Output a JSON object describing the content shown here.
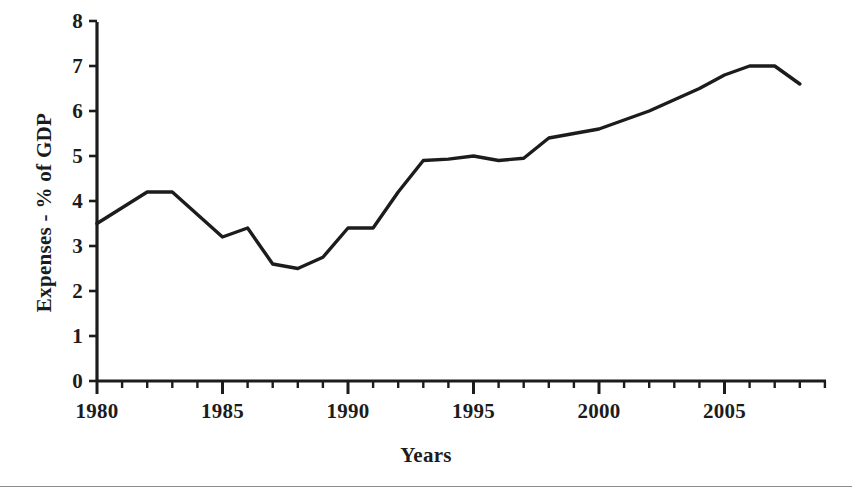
{
  "figure": {
    "background_color": "#ffffff",
    "ink_color": "#1c1c1c",
    "bottom_rule_color": "#8d8d8d"
  },
  "axes": {
    "y_title": "Expenses - % of GDP",
    "x_title": "Years",
    "y_tick_labels": [
      "0",
      "1",
      "2",
      "3",
      "4",
      "5",
      "6",
      "7",
      "8"
    ],
    "x_tick_labels": [
      "1980",
      "1985",
      "1990",
      "1995",
      "2000",
      "2005"
    ]
  },
  "chart_data": {
    "type": "line",
    "title": "",
    "subtitle": "",
    "xlabel": "Years",
    "ylabel": "Expenses - % of GDP",
    "xlim": [
      1979.2,
      2009.0
    ],
    "ylim": [
      0,
      8
    ],
    "grid": false,
    "legend": null,
    "annotations": [],
    "y_major_ticks": [
      0,
      1,
      2,
      3,
      4,
      5,
      6,
      7,
      8
    ],
    "x_major_ticks": [
      1980,
      1985,
      1990,
      1995,
      2000,
      2005
    ],
    "x_minor_tick_interval": 1,
    "line_color": "#1c1c1c",
    "line_width_px": 3.4,
    "x": [
      1980,
      1981,
      1982,
      1983,
      1984,
      1985,
      1986,
      1987,
      1988,
      1989,
      1990,
      1991,
      1992,
      1993,
      1994,
      1995,
      1996,
      1997,
      1998,
      1999,
      2000,
      2001,
      2002,
      2003,
      2004,
      2005,
      2006,
      2007,
      2008
    ],
    "values": [
      3.5,
      3.85,
      4.2,
      4.2,
      3.7,
      3.2,
      3.4,
      2.6,
      2.5,
      2.75,
      3.4,
      3.4,
      4.2,
      4.9,
      4.93,
      5.0,
      4.9,
      4.95,
      5.4,
      5.5,
      5.6,
      5.8,
      6.0,
      6.25,
      6.5,
      6.8,
      7.0,
      7.0,
      6.6
    ],
    "series": [
      {
        "name": "Expenses - % of GDP",
        "values": [
          3.5,
          3.85,
          4.2,
          4.2,
          3.7,
          3.2,
          3.4,
          2.6,
          2.5,
          2.75,
          3.4,
          3.4,
          4.2,
          4.9,
          4.93,
          5.0,
          4.9,
          4.95,
          5.4,
          5.5,
          5.6,
          5.8,
          6.0,
          6.25,
          6.5,
          6.8,
          7.0,
          7.0,
          6.6
        ]
      }
    ]
  }
}
